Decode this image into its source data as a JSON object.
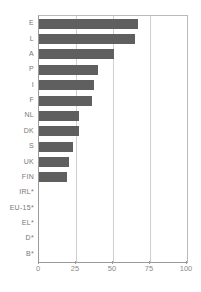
{
  "chart_data": {
    "type": "bar",
    "orientation": "horizontal",
    "title": "",
    "subtitle": "",
    "xlabel": "",
    "ylabel": "",
    "xlim": [
      0,
      100
    ],
    "xticks": [
      0,
      25,
      50,
      75,
      100
    ],
    "xtick_labels": [
      "0",
      "25",
      "50",
      "75",
      "100"
    ],
    "grid": true,
    "grid_axis": "x",
    "legend": false,
    "legend_position": "none",
    "bar_color": "#5f5f5f",
    "gridline_color": "#cfcfcf",
    "axis_color": "#9a9a9a",
    "label_color": "#777777",
    "categories": [
      "E",
      "L",
      "A",
      "P",
      "I",
      "F",
      "NL",
      "DK",
      "S",
      "UK",
      "FIN",
      "IRL*",
      "EU-15*",
      "EL*",
      "D*",
      "B*"
    ],
    "values": [
      67,
      65,
      51,
      40,
      37,
      36,
      27,
      27,
      23,
      20,
      19,
      0,
      0,
      0,
      0,
      0
    ],
    "bars": [
      {
        "label": "E",
        "value": 67
      },
      {
        "label": "L",
        "value": 65
      },
      {
        "label": "A",
        "value": 51
      },
      {
        "label": "P",
        "value": 40
      },
      {
        "label": "I",
        "value": 37
      },
      {
        "label": "F",
        "value": 36
      },
      {
        "label": "NL",
        "value": 27
      },
      {
        "label": "DK",
        "value": 27
      },
      {
        "label": "S",
        "value": 23
      },
      {
        "label": "UK",
        "value": 20
      },
      {
        "label": "FIN",
        "value": 19
      },
      {
        "label": "IRL*",
        "value": 0
      },
      {
        "label": "EU-15*",
        "value": 0
      },
      {
        "label": "EL*",
        "value": 0
      },
      {
        "label": "D*",
        "value": 0
      },
      {
        "label": "B*",
        "value": 0
      }
    ]
  }
}
